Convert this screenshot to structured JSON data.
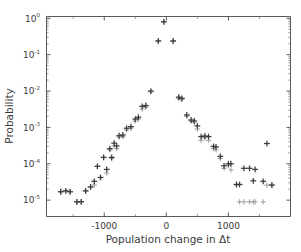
{
  "chart_data": {
    "type": "scatter",
    "title": "",
    "xlabel": "Population change in Δt",
    "ylabel": "Probability",
    "xlim": [
      -1930,
      2000
    ],
    "ylim_log10": [
      -5.45,
      0.05
    ],
    "yscale": "log",
    "xscale": "linear",
    "grid": false,
    "legend": "none",
    "xticks": [
      -1000,
      0,
      1000
    ],
    "xticklabels": [
      "-1000",
      "0",
      "1000"
    ],
    "yticks_log10": [
      0,
      -1,
      -2,
      -3,
      -4,
      -5
    ],
    "yticklabels": [
      "10^0",
      "10^-1",
      "10^-2",
      "10^-3",
      "10^-4",
      "10^-5"
    ],
    "ytick_mantissa": "10",
    "ytick_exponents": [
      "0",
      "-1",
      "-2",
      "-3",
      "-4",
      "-5"
    ],
    "marker": "plus",
    "series": [
      {
        "name": "series-dark",
        "color": "#3c3c3c",
        "points": [
          [
            -1700,
            1.7e-05
          ],
          [
            -1620,
            1.8e-05
          ],
          [
            -1550,
            1.7e-05
          ],
          [
            -1440,
            9e-06
          ],
          [
            -1370,
            9e-06
          ],
          [
            -1300,
            1.8e-05
          ],
          [
            -1220,
            2.3e-05
          ],
          [
            -1160,
            3.3e-05
          ],
          [
            -1110,
            8.5e-05
          ],
          [
            -1060,
            4.2e-05
          ],
          [
            -1010,
            0.00015
          ],
          [
            -960,
            7e-05
          ],
          [
            -910,
            0.00026
          ],
          [
            -880,
            0.00015
          ],
          [
            -840,
            0.00037
          ],
          [
            -800,
            0.00031
          ],
          [
            -760,
            0.00059
          ],
          [
            -700,
            0.00062
          ],
          [
            -640,
            0.00095
          ],
          [
            -570,
            0.00105
          ],
          [
            -500,
            0.0017
          ],
          [
            -450,
            0.0019
          ],
          [
            -390,
            0.0038
          ],
          [
            -330,
            0.004
          ],
          [
            -250,
            0.01
          ],
          [
            -130,
            0.24
          ],
          [
            -40,
            0.8
          ],
          [
            110,
            0.24
          ],
          [
            200,
            0.0068
          ],
          [
            250,
            0.0063
          ],
          [
            330,
            0.0022
          ],
          [
            400,
            0.0016
          ],
          [
            450,
            0.0015
          ],
          [
            500,
            0.0011
          ],
          [
            560,
            0.00056
          ],
          [
            620,
            0.00058
          ],
          [
            680,
            0.00056
          ],
          [
            760,
            0.0003
          ],
          [
            800,
            0.00029
          ],
          [
            870,
            0.00016
          ],
          [
            930,
            8.8e-05
          ],
          [
            1000,
            0.0001
          ],
          [
            1040,
            0.0001
          ],
          [
            1130,
            2.7e-05
          ],
          [
            1180,
            2.7e-05
          ],
          [
            1250,
            7.5e-05
          ],
          [
            1340,
            7.5e-05
          ],
          [
            1400,
            3.4e-05
          ],
          [
            1430,
            7e-05
          ],
          [
            1560,
            3.3e-05
          ],
          [
            1620,
            0.00036
          ],
          [
            1700,
            2.6e-05
          ]
        ]
      },
      {
        "name": "series-light",
        "color": "#a8a8a8",
        "points": [
          [
            -1700,
            1.7e-05
          ],
          [
            -1620,
            1.8e-05
          ],
          [
            -1550,
            1.7e-05
          ],
          [
            -1440,
            9e-06
          ],
          [
            -1370,
            9e-06
          ],
          [
            -1300,
            1.8e-05
          ],
          [
            -1220,
            2.3e-05
          ],
          [
            -1160,
            2.6e-05
          ],
          [
            -1110,
            8.5e-05
          ],
          [
            -1060,
            4.2e-05
          ],
          [
            -1010,
            0.00015
          ],
          [
            -960,
            5.5e-05
          ],
          [
            -910,
            0.00024
          ],
          [
            -880,
            0.00014
          ],
          [
            -840,
            0.00031
          ],
          [
            -800,
            0.00026
          ],
          [
            -760,
            0.00054
          ],
          [
            -700,
            0.00056
          ],
          [
            -640,
            0.00085
          ],
          [
            -570,
            0.00095
          ],
          [
            -500,
            0.0015
          ],
          [
            -450,
            0.0017
          ],
          [
            -390,
            0.0032
          ],
          [
            -330,
            0.0036
          ],
          [
            -250,
            0.0095
          ],
          [
            -130,
            0.23
          ],
          [
            -40,
            0.8
          ],
          [
            110,
            0.23
          ],
          [
            200,
            0.0062
          ],
          [
            250,
            0.0058
          ],
          [
            330,
            0.002
          ],
          [
            400,
            0.0015
          ],
          [
            450,
            0.0014
          ],
          [
            500,
            0.0009
          ],
          [
            560,
            0.00044
          ],
          [
            620,
            0.00052
          ],
          [
            680,
            0.00044
          ],
          [
            760,
            0.00026
          ],
          [
            800,
            0.00024
          ],
          [
            870,
            0.00014
          ],
          [
            930,
            7.5e-05
          ],
          [
            1000,
            9e-05
          ],
          [
            1040,
            6.8e-05
          ],
          [
            1130,
            2.6e-05
          ],
          [
            1180,
            9e-06
          ],
          [
            1250,
            9e-06
          ],
          [
            1340,
            9e-06
          ],
          [
            1400,
            9e-06
          ],
          [
            1430,
            9e-06
          ],
          [
            1560,
            9e-06
          ],
          [
            1620,
            2.6e-05
          ],
          [
            1700,
            2.6e-05
          ]
        ]
      }
    ]
  },
  "axes": {
    "x_title": "Population change in Δt",
    "y_title": "Probability"
  }
}
